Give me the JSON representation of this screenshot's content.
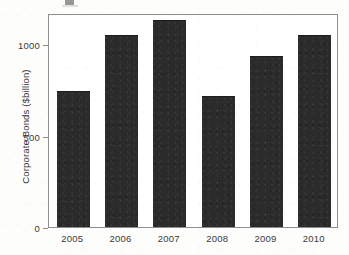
{
  "figure": {
    "background_color": "#fdfdfc",
    "frame_color": "#8e8e8e",
    "bar_color": "#2b2b2b",
    "top_crop_artifact": true
  },
  "chart_data": {
    "type": "bar",
    "title": "",
    "subtitle": "",
    "xlabel": "",
    "ylabel": "Corporate Bonds ($billion)",
    "categories": [
      "2005",
      "2006",
      "2007",
      "2008",
      "2009",
      "2010"
    ],
    "values": [
      745,
      1052,
      1134,
      718,
      937,
      1052
    ],
    "series": [
      {
        "name": "Corporate Bonds",
        "values": [
          745,
          1052,
          1134,
          718,
          937,
          1052
        ]
      }
    ],
    "ylim": [
      0,
      1172
    ],
    "xlim_note": "categorical",
    "ytick_values": [
      0,
      500,
      1000
    ],
    "ytick_labels": [
      "0",
      "500",
      "1000"
    ],
    "xtick_labels": [
      "2005",
      "2006",
      "2007",
      "2008",
      "2009",
      "2010"
    ],
    "grid": false,
    "legend": null,
    "legend_position": "none",
    "annotations": [],
    "bar_color": "#2b2b2b",
    "axis_frame": "box"
  }
}
